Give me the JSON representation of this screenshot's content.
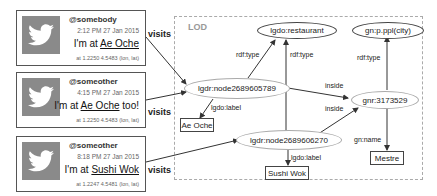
{
  "tweets": [
    {
      "user": "@somebody",
      "time": "2:12 PM 27 Jan 2015",
      "msg_prefix": "I'm at ",
      "place": "Ae Oche",
      "msg_suffix": "",
      "coords": "at 1.2250 4.5483 (lon, lat)",
      "icon": "twitter-bird-icon"
    },
    {
      "user": "@someother",
      "time": "4:15 PM 27 Jan 2015",
      "msg_prefix": "I'm at ",
      "place": "Ae Oche",
      "msg_suffix": " too!",
      "coords": "at 1.2250 4.5483 (lon, lat)",
      "icon": "twitter-bird-icon"
    },
    {
      "user": "@someother",
      "time": "8:18 PM 27 Jan 2015",
      "msg_prefix": "I'm at ",
      "place": "Sushi Wok",
      "msg_suffix": "",
      "coords": "at 1.2247 4.5481 (lon, lat)",
      "icon": "twitter-bird-icon"
    }
  ],
  "visits_label": "visits",
  "lod": {
    "title": "LOD",
    "nodes": {
      "restaurant": "lgdo:restaurant",
      "city": "gn:p.ppl(city)",
      "node1": "lgdr:node2689605789",
      "node2": "lgdr:node2689606270",
      "gnr": "gnr:3173529",
      "aeoche": "Ae Oche",
      "sushiwok": "Sushi Wok",
      "mestre": "Mestre"
    },
    "edges": {
      "rdf_type": "rdf:type",
      "inside": "inside",
      "lgdo_label": "lgdo:label",
      "gn_name": "gn:name"
    }
  },
  "colors": {
    "stroke": "#444444",
    "dashed_border": "#aaaaaa",
    "avatar": "#8a8a8a"
  }
}
